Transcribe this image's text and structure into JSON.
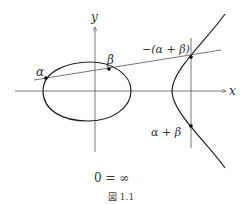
{
  "figure": {
    "caption": "図 1.1",
    "axes": {
      "x_label": "x",
      "y_label": "y"
    },
    "points": [
      {
        "id": "alpha",
        "label": "α"
      },
      {
        "id": "beta",
        "label": "β"
      },
      {
        "id": "neg-sum",
        "label": "−(α + β)"
      },
      {
        "id": "sum",
        "label": "α + β"
      }
    ],
    "note": "0 = ∞",
    "colors": {
      "curve": "#222222",
      "axis": "#555555",
      "secant": "#555555",
      "point": "#000000"
    }
  }
}
